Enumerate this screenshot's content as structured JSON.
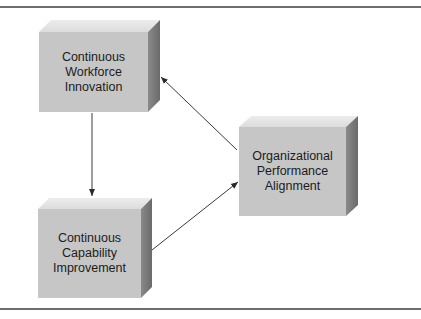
{
  "diagram": {
    "boxes": [
      {
        "id": "workforce-innovation",
        "lines": [
          "Continuous",
          "Workforce",
          "Innovation"
        ]
      },
      {
        "id": "capability-improvement",
        "lines": [
          "Continuous",
          "Capability",
          "Improvement"
        ]
      },
      {
        "id": "performance-alignment",
        "lines": [
          "Organizational",
          "Performance",
          "Alignment"
        ]
      }
    ],
    "arrows": [
      {
        "from": "workforce-innovation",
        "to": "capability-improvement"
      },
      {
        "from": "capability-improvement",
        "to": "performance-alignment"
      },
      {
        "from": "performance-alignment",
        "to": "workforce-innovation"
      }
    ],
    "colors": {
      "front_face": "#c4c4c4",
      "top_face": "#e2e2e2",
      "side_face": "#7a7a7a",
      "arrow": "#3a3a3a",
      "rule": "#6e6e6e"
    }
  }
}
